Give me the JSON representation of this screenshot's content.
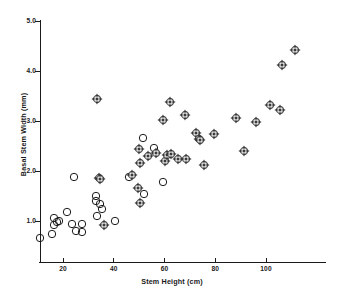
{
  "chart_data": {
    "type": "scatter",
    "title": "",
    "xlabel": "Stem Height (cm)",
    "ylabel": "Basal Stem Width (mm)",
    "xlim": [
      10,
      115
    ],
    "ylim": [
      0.5,
      5.0
    ],
    "xticks": [
      20,
      40,
      60,
      80,
      100
    ],
    "xtick_labels": [
      "20",
      "40",
      "60",
      "80",
      "100"
    ],
    "yticks": [
      1.0,
      2.0,
      3.0,
      4.0,
      5.0
    ],
    "ytick_labels": [
      "1.0",
      "2.0",
      "3.0",
      "4.0",
      "5.0"
    ],
    "grid": false,
    "legend": null,
    "marker_colors": {
      "open": "#1a1a1a",
      "filled": "#3a3a3a"
    },
    "series": [
      {
        "name": "open-circle",
        "marker": "circle-open",
        "points": [
          [
            11.0,
            0.66
          ],
          [
            15.5,
            0.74
          ],
          [
            16.5,
            1.06
          ],
          [
            16.5,
            0.93
          ],
          [
            17.5,
            0.98
          ],
          [
            18.5,
            1.0
          ],
          [
            21.5,
            1.18
          ],
          [
            23.5,
            0.94
          ],
          [
            24.5,
            1.88
          ],
          [
            25.0,
            0.8
          ],
          [
            27.5,
            0.79
          ],
          [
            27.5,
            0.95
          ],
          [
            33.0,
            1.51
          ],
          [
            33.0,
            1.41
          ],
          [
            33.5,
            1.11
          ],
          [
            34.5,
            1.35
          ],
          [
            35.5,
            1.25
          ],
          [
            40.5,
            1.01
          ],
          [
            46.0,
            1.89
          ],
          [
            51.5,
            2.66
          ],
          [
            52.0,
            1.55
          ],
          [
            56.0,
            2.47
          ],
          [
            59.5,
            1.79
          ]
        ]
      },
      {
        "name": "circle-diamond",
        "marker": "circle-diamond",
        "points": [
          [
            33.5,
            3.45
          ],
          [
            34.0,
            1.86
          ],
          [
            34.5,
            1.85
          ],
          [
            36.0,
            0.93
          ],
          [
            47.0,
            1.93
          ],
          [
            49.5,
            1.66
          ],
          [
            50.0,
            2.45
          ],
          [
            50.5,
            2.17
          ],
          [
            50.5,
            1.36
          ],
          [
            53.5,
            2.31
          ],
          [
            56.5,
            2.36
          ],
          [
            59.5,
            3.03
          ],
          [
            60.0,
            2.21
          ],
          [
            61.0,
            2.33
          ],
          [
            62.0,
            3.39
          ],
          [
            62.5,
            2.35
          ],
          [
            65.5,
            2.25
          ],
          [
            68.0,
            3.13
          ],
          [
            68.5,
            2.24
          ],
          [
            72.5,
            2.77
          ],
          [
            73.5,
            2.65
          ],
          [
            74.0,
            2.62
          ],
          [
            75.5,
            2.13
          ],
          [
            79.5,
            2.75
          ],
          [
            88.0,
            3.06
          ],
          [
            91.5,
            2.41
          ],
          [
            96.0,
            2.98
          ],
          [
            101.5,
            3.32
          ],
          [
            105.5,
            3.22
          ],
          [
            106.5,
            4.13
          ],
          [
            111.5,
            4.43
          ]
        ]
      }
    ]
  }
}
